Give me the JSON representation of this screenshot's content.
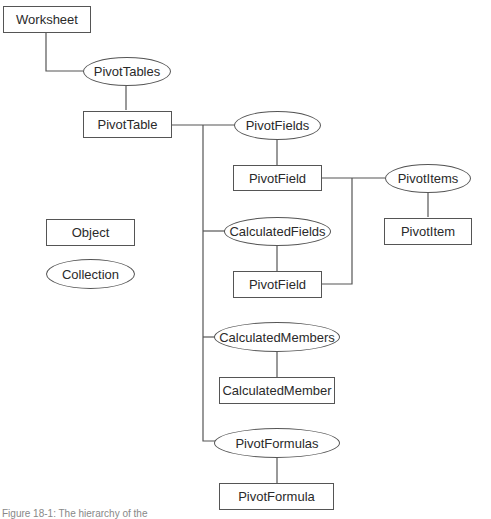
{
  "diagram": {
    "nodes": {
      "worksheet": "Worksheet",
      "pivottables": "PivotTables",
      "pivottable": "PivotTable",
      "pivotfields": "PivotFields",
      "pivotfield_1": "PivotField",
      "pivotitems": "PivotItems",
      "pivotitem": "PivotItem",
      "calculatedfields": "CalculatedFields",
      "pivotfield_2": "PivotField",
      "calculatedmembers": "CalculatedMembers",
      "calculatedmember": "CalculatedMember",
      "pivotformulas": "PivotFormulas",
      "pivotformula": "PivotFormula"
    },
    "legend": {
      "object": "Object",
      "collection": "Collection"
    },
    "caption": "Figure 18-1: The hierarchy of the"
  }
}
